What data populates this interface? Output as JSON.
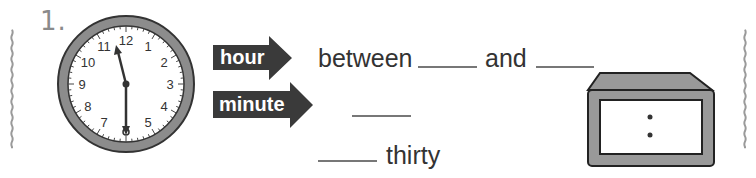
{
  "problem": {
    "number": "1.",
    "analog_clock": {
      "numbers": [
        "12",
        "1",
        "2",
        "3",
        "4",
        "5",
        "6",
        "7",
        "8",
        "9",
        "10",
        "11"
      ],
      "hour_hand_time": "11:30",
      "minute_hand_points_to": "6"
    },
    "hour_arrow": {
      "label": "hour"
    },
    "minute_arrow": {
      "label": "minute"
    },
    "hour_line": {
      "prefix": "between",
      "connector": "and",
      "blank1": "",
      "blank2": ""
    },
    "minute_line": {
      "blank": ""
    },
    "time_line": {
      "blank": "",
      "suffix": "thirty"
    },
    "digital_clock": {
      "display": ":"
    }
  },
  "colors": {
    "border": "#9a9a9a",
    "arrow_fill": "#3a3a3a",
    "clock_ring": "#8c8c8c",
    "text": "#333333",
    "number_label": "#8a8a8a",
    "digital_frame": "#999999"
  }
}
